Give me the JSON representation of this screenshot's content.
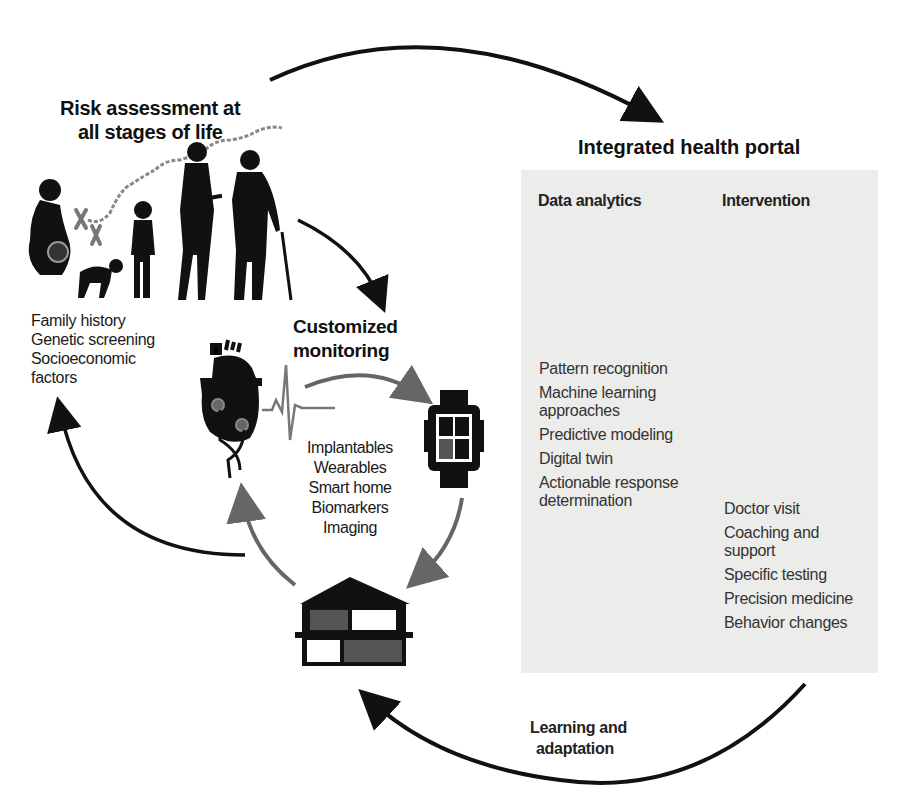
{
  "risk_assessment": {
    "title_line1": "Risk assessment at",
    "title_line2": "all stages of life",
    "factors": [
      "Family history",
      "Genetic screening",
      "Socioeconomic",
      "factors"
    ]
  },
  "customized_monitoring": {
    "title_line1": "Customized",
    "title_line2": "monitoring",
    "items": [
      "Implantables",
      "Wearables",
      "Smart home",
      "Biomarkers",
      "Imaging"
    ]
  },
  "integrated_health_portal": {
    "title": "Integrated health portal",
    "data_analytics": {
      "heading": "Data analytics",
      "items": [
        "Pattern recognition",
        "Machine learning",
        "approaches",
        "Predictive modeling",
        "Digital twin",
        "Actionable response",
        "determination"
      ]
    },
    "intervention": {
      "heading": "Intervention",
      "items": [
        "Doctor visit",
        "Coaching and",
        "support",
        "Specific testing",
        "Precision medicine",
        "Behavior changes"
      ]
    }
  },
  "learning": {
    "line1": "Learning and",
    "line2": "adaptation"
  },
  "icons": {
    "life_stages": "people-silhouettes-icon",
    "dna": "dna-strand-icon",
    "chromosome": "chromosome-icon",
    "heart": "heart-implant-icon",
    "ecg": "ecg-wave-icon",
    "watch": "smartwatch-icon",
    "house": "smart-home-icon",
    "chart": "bar-chart-magnifier-icon",
    "hospital": "hospital-building-icon",
    "doctors": "doctor-patient-icon"
  },
  "colors": {
    "arrow_dark": "#111111",
    "arrow_gray": "#666666",
    "panel_bg": "#ececea",
    "accent_gray": "#7a7a7a"
  }
}
